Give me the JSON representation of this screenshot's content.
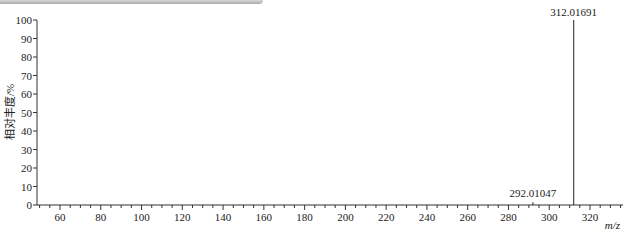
{
  "chart_data": {
    "type": "bar",
    "subtype": "mass-spectrum-stick",
    "title": "",
    "xlabel": "m/z",
    "ylabel": "相对丰度/%",
    "xlim": [
      49,
      335
    ],
    "ylim": [
      0,
      100
    ],
    "x_ticks": [
      60,
      80,
      100,
      120,
      140,
      160,
      180,
      200,
      220,
      240,
      260,
      280,
      300,
      320
    ],
    "y_ticks": [
      0,
      10,
      20,
      30,
      40,
      50,
      60,
      70,
      80,
      90,
      100
    ],
    "grid": false,
    "legend": null,
    "peaks": [
      {
        "mz": 292.01047,
        "label": "292.01047",
        "abundance": 1.5
      },
      {
        "mz": 312.01691,
        "label": "312.01691",
        "abundance": 100
      }
    ]
  }
}
